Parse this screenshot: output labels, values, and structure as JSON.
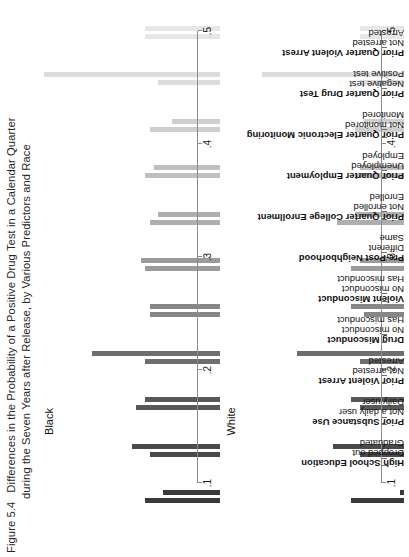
{
  "figure": {
    "number": "Figure 5.4",
    "title_line1": "Differences in the Probability of a Positive Drug Test in a Calendar Quarter",
    "title_line2": "during the Seven Years after Release, by Various Predictors and Race"
  },
  "axis": {
    "ticks": [
      ".1",
      ".2",
      ".3",
      ".4",
      ".5"
    ],
    "values": [
      0.1,
      0.2,
      0.3,
      0.4,
      0.5
    ],
    "min": 0.1,
    "max": 0.5
  },
  "panels": [
    {
      "id": "black",
      "label": "Black"
    },
    {
      "id": "white",
      "label": "White"
    }
  ],
  "groups": [
    {
      "heading": "High School Education",
      "levels": [
        "Dropped out",
        "Graduated"
      ]
    },
    {
      "heading": "Prior Substance Use",
      "levels": [
        "Not a daily user",
        "Daily user"
      ]
    },
    {
      "heading": "Prior Violent Arrest",
      "levels": [
        "Not arrested",
        "Arrested"
      ]
    },
    {
      "heading": "Drug Misconduct",
      "levels": [
        "No misconduct",
        "Has misconduct"
      ]
    },
    {
      "heading": "Violent Misconduct",
      "levels": [
        "No misconduct",
        "Has misconduct"
      ]
    },
    {
      "heading": "Pre-Post Neighborhood",
      "levels": [
        "Different",
        "Same"
      ]
    },
    {
      "heading": "Prior Quarter College Enrollment",
      "levels": [
        "Not enrolled",
        "Enrolled"
      ]
    },
    {
      "heading": "Prior Quarter Employment",
      "levels": [
        "Unemployed",
        "Employed"
      ]
    },
    {
      "heading": "Prior Quarter Electronic Monitoring",
      "levels": [
        "Not monitored",
        "Monitored"
      ]
    },
    {
      "heading": "Prior Quarter Drug Test",
      "levels": [
        "Negative test",
        "Positive test"
      ]
    },
    {
      "heading": "Prior Quarter Violent Arrest",
      "levels": [
        "Not arrested",
        "Arrested"
      ]
    }
  ],
  "colors": {
    "bars": [
      "#3a3a3a",
      "#3a3a3a",
      "#4a4a4a",
      "#4a4a4a",
      "#585858",
      "#585858",
      "#6e6e6e",
      "#6e6e6e",
      "#868686",
      "#868686",
      "#9b9b9b",
      "#9b9b9b",
      "#aeaeae",
      "#aeaeae",
      "#bfbfbf",
      "#bfbfbf",
      "#cfcfcf",
      "#cfcfcf",
      "#dcdcdc",
      "#dcdcdc",
      "#e6e6e6",
      "#e6e6e6"
    ],
    "axis": "#8c8c8c",
    "text": "#1a1a1a"
  },
  "chart_data": {
    "type": "bar",
    "title": "Differences in the Probability of a Positive Drug Test in a Calendar Quarter during the Seven Years after Release, by Various Predictors and Race",
    "xlabel": "",
    "ylabel": "",
    "ylim": [
      0.1,
      0.5
    ],
    "grid": false,
    "legend": "none",
    "orientation": "vertical-bars-on-rotated-page",
    "categories": [
      "High School Education: Dropped out",
      "High School Education: Graduated",
      "Prior Substance Use: Not a daily user",
      "Prior Substance Use: Daily user",
      "Prior Violent Arrest: Not arrested",
      "Prior Violent Arrest: Arrested",
      "Drug Misconduct: No misconduct",
      "Drug Misconduct: Has misconduct",
      "Violent Misconduct: No misconduct",
      "Violent Misconduct: Has misconduct",
      "Pre-Post Neighborhood: Different",
      "Pre-Post Neighborhood: Same",
      "Prior Quarter College Enrollment: Not enrolled",
      "Prior Quarter College Enrollment: Enrolled",
      "Prior Quarter Employment: Unemployed",
      "Prior Quarter Employment: Employed",
      "Prior Quarter Electronic Monitoring: Not monitored",
      "Prior Quarter Electronic Monitoring: Monitored",
      "Prior Quarter Drug Test: Negative test",
      "Prior Quarter Drug Test: Positive test",
      "Prior Quarter Violent Arrest: Not arrested",
      "Prior Quarter Violent Arrest: Arrested"
    ],
    "series": [
      {
        "name": "Black",
        "values": [
          0.27,
          0.23,
          0.26,
          0.3,
          0.29,
          0.27,
          0.27,
          0.39,
          0.26,
          0.26,
          0.27,
          0.28,
          0.26,
          0.24,
          0.27,
          0.25,
          0.26,
          0.21,
          0.24,
          0.5,
          0.27,
          0.27
        ]
      },
      {
        "name": "White",
        "values": [
          0.22,
          0.11,
          0.2,
          0.26,
          0.2,
          0.22,
          0.2,
          0.34,
          0.19,
          0.22,
          0.22,
          0.2,
          0.25,
          0.21,
          0.21,
          0.2,
          0.21,
          0.19,
          0.2,
          0.42,
          0.2,
          0.2
        ]
      }
    ]
  }
}
